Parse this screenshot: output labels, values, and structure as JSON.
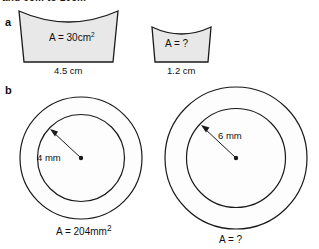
{
  "figure": {
    "top_cropped_heading": "and 6cm to 10cm",
    "top_right_marker": "3",
    "background_color": "#ffffff",
    "stroke_color": "#1a1a1a",
    "shape_fill_color": "#e8e8e8",
    "circle_fill_color": "#fdfdfd"
  },
  "parts": {
    "a": {
      "label": "a",
      "shapes": [
        {
          "name": "large-curved-trapezium",
          "area_label_prefix": "A = ",
          "area_value": "30",
          "area_unit": "cm",
          "area_exponent": "2",
          "area_label": "A = 30 cm",
          "base_dimension": "4.5 cm"
        },
        {
          "name": "small-curved-trapezium",
          "area_label_prefix": "A = ",
          "area_value": "?",
          "area_unit": "",
          "area_exponent": "",
          "area_label": "A = ?",
          "base_dimension": "1.2 cm"
        }
      ]
    },
    "b": {
      "label": "b",
      "shapes": [
        {
          "name": "small-annulus",
          "radius_label": "4 mm",
          "area_label_prefix": "A = ",
          "area_value": "204",
          "area_unit": "mm",
          "area_exponent": "2",
          "area_label": "A = 204 mm"
        },
        {
          "name": "large-annulus",
          "radius_label": "6 mm",
          "area_label_prefix": "A = ",
          "area_value": "?",
          "area_unit": "",
          "area_exponent": "",
          "area_label": "A = ?"
        }
      ]
    }
  }
}
